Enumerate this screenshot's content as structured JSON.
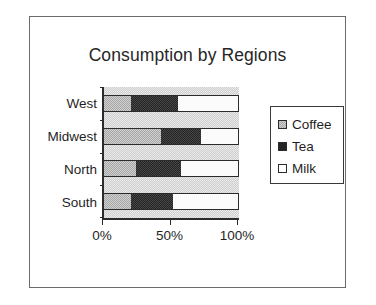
{
  "chart_data": {
    "type": "bar",
    "orientation": "horizontal",
    "stacked": true,
    "stack_mode": "percent",
    "title": "Consumption by Regions",
    "xlabel": "",
    "ylabel": "",
    "categories": [
      "West",
      "Midwest",
      "North",
      "South"
    ],
    "series": [
      {
        "name": "Coffee",
        "color": "#a8a8a8",
        "values": [
          20,
          42,
          24,
          20
        ]
      },
      {
        "name": "Tea",
        "color": "#242424",
        "values": [
          35,
          30,
          33,
          31
        ]
      },
      {
        "name": "Milk",
        "color": "#ffffff",
        "values": [
          45,
          28,
          43,
          49
        ]
      }
    ],
    "xlim": [
      0,
      100
    ],
    "xticks": [
      0,
      50,
      100
    ],
    "xtick_labels": [
      "0%",
      "50%",
      "100%"
    ],
    "grid": false,
    "legend_position": "right",
    "plot_background": "#cfcfcf",
    "frame": true
  },
  "legend": {
    "items": [
      {
        "label": "Coffee",
        "swatch": "coffee-swatch"
      },
      {
        "label": "Tea",
        "swatch": "tea-swatch"
      },
      {
        "label": "Milk",
        "swatch": "milk-swatch"
      }
    ]
  }
}
